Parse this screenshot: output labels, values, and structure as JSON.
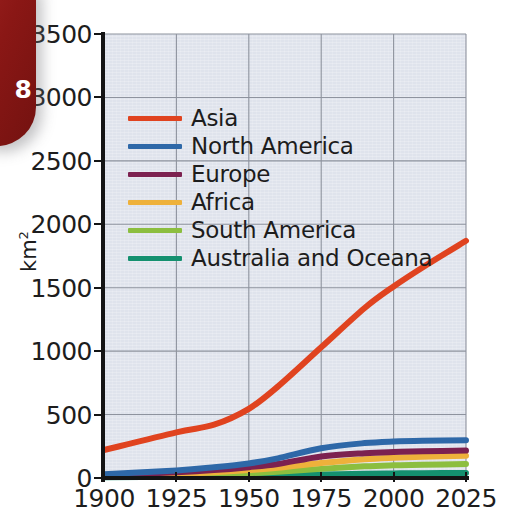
{
  "page_tab": {
    "number": "8",
    "color": "#8e1a18"
  },
  "chart_data": {
    "type": "line",
    "title": "",
    "xlabel": "",
    "ylabel": "km2",
    "ylabel_display": "km",
    "ylabel_superscript": "2",
    "xlim": [
      1900,
      2025
    ],
    "ylim": [
      0,
      3500
    ],
    "xticks": [
      "1900",
      "1925",
      "1950",
      "1975",
      "2000",
      "2025"
    ],
    "yticks": [
      "0",
      "500",
      "1000",
      "1500",
      "2000",
      "2500",
      "3000",
      "3500"
    ],
    "grid": true,
    "grid_color": "#8e939e",
    "plot_background": "#dfe3ec",
    "legend_position": "upper left",
    "x": [
      1900,
      1925,
      1938,
      1950,
      1960,
      1975,
      1990,
      2000,
      2010,
      2025
    ],
    "series": [
      {
        "name": "Asia",
        "color": "#e0431f",
        "values": [
          220,
          360,
          420,
          545,
          720,
          1030,
          1340,
          1510,
          1660,
          1870
        ]
      },
      {
        "name": "North America",
        "color": "#2e68a8",
        "values": [
          30,
          60,
          85,
          115,
          155,
          235,
          275,
          288,
          294,
          297
        ]
      },
      {
        "name": "Europe",
        "color": "#7c2150",
        "values": [
          22,
          45,
          62,
          85,
          110,
          170,
          196,
          205,
          210,
          216
        ]
      },
      {
        "name": "Africa",
        "color": "#eeb13b",
        "values": [
          15,
          32,
          45,
          62,
          80,
          118,
          148,
          160,
          168,
          176
        ]
      },
      {
        "name": "South America",
        "color": "#8cbe3f",
        "values": [
          10,
          20,
          28,
          38,
          50,
          72,
          92,
          100,
          105,
          110
        ]
      },
      {
        "name": "Australia and Oceana",
        "color": "#14906f",
        "values": [
          5,
          9,
          12,
          16,
          20,
          28,
          33,
          36,
          38,
          40
        ]
      }
    ]
  }
}
